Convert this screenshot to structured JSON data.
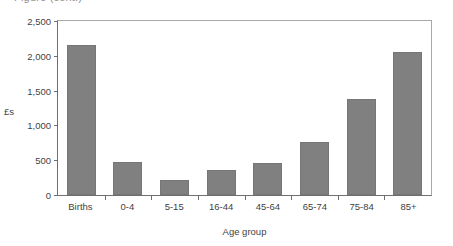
{
  "title_remnant": "Figure (cont.)",
  "chart_data": {
    "type": "bar",
    "title": "",
    "xlabel": "Age group",
    "ylabel": "£s",
    "categories": [
      "Births",
      "0-4",
      "5-15",
      "16-44",
      "45-64",
      "65-74",
      "75-84",
      "85+"
    ],
    "values": [
      2160,
      470,
      210,
      355,
      455,
      755,
      1380,
      2060
    ],
    "ylim": [
      0,
      2500
    ],
    "ytick_values": [
      0,
      500,
      1000,
      1500,
      2000,
      2500
    ],
    "ytick_labels": [
      "0",
      "500",
      "1,000",
      "1,500",
      "2,000",
      "2,500"
    ],
    "grid": false,
    "legend": false,
    "bar_color": "#808080",
    "axis_color": "#6f6f6f",
    "frame_color": "#a8a8a8"
  }
}
